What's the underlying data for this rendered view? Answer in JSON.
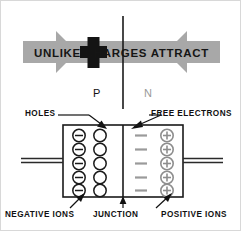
{
  "figure": {
    "banner": {
      "text": "UNLIKE CHARGES ATTRACT",
      "band_color": "#a8a8a8",
      "plus_color": "#1a1a1a",
      "arrow_left_name": "arrow-right-gray",
      "arrow_right_name": "arrow-left-gray"
    },
    "regions": {
      "p_label": "P",
      "n_label": "N",
      "p_color": "#111111",
      "n_color": "#9a9a9a"
    },
    "callouts": {
      "holes": "HOLES",
      "free_electrons": "FREE  ELECTRONS",
      "negative_ions": "NEGATIVE  IONS",
      "junction": "JUNCTION",
      "positive_ions": "POSITIVE  IONS"
    },
    "diagram": {
      "junction_line_color": "#1a1a1a",
      "body_outline_color": "#1a1a1a",
      "lead_color": "#2a2a2a",
      "negative_ion_symbol": "minus-in-circle",
      "hole_symbol": "empty-circle",
      "free_electron_symbol": "dash",
      "positive_ion_symbol": "plus-in-circle",
      "negative_ion_count": 5,
      "hole_count": 5,
      "free_electron_count": 5,
      "positive_ion_count": 5,
      "p_side_color": "#1a1a1a",
      "n_side_color": "#9a9a9a"
    }
  }
}
